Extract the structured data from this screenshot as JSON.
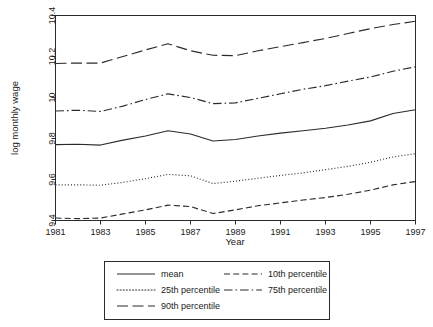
{
  "chart_data": {
    "type": "line",
    "title": "",
    "xlabel": "Year",
    "ylabel": "log monthly wage",
    "xlim": [
      1981,
      1997
    ],
    "ylim": [
      9.4,
      10.4
    ],
    "grid": false,
    "legend_position": "below-center",
    "x": [
      1981,
      1982,
      1983,
      1984,
      1985,
      1986,
      1987,
      1988,
      1989,
      1990,
      1991,
      1992,
      1993,
      1994,
      1995,
      1996,
      1997
    ],
    "xtick_labels": [
      "1981",
      "1983",
      "1985",
      "1987",
      "1989",
      "1991",
      "1993",
      "1995",
      "1997"
    ],
    "xtick_values": [
      1981,
      1983,
      1985,
      1987,
      1989,
      1991,
      1993,
      1995,
      1997
    ],
    "ytick_labels": [
      "9.4",
      "9.6",
      "9.8",
      "10",
      "10.2",
      "10.4"
    ],
    "ytick_values": [
      9.4,
      9.6,
      9.8,
      10.0,
      10.2,
      10.4
    ],
    "series": [
      {
        "name": "mean",
        "dash": "none",
        "values": [
          9.77,
          9.772,
          9.768,
          9.792,
          9.812,
          9.838,
          9.822,
          9.788,
          9.795,
          9.812,
          9.826,
          9.838,
          9.85,
          9.866,
          9.886,
          9.922,
          9.94
        ]
      },
      {
        "name": "10th percentile",
        "dash": "dashed",
        "values": [
          9.412,
          9.409,
          9.412,
          9.432,
          9.452,
          9.475,
          9.468,
          9.434,
          9.452,
          9.472,
          9.486,
          9.5,
          9.512,
          9.528,
          9.548,
          9.574,
          9.59
        ]
      },
      {
        "name": "25th percentile",
        "dash": "dotted",
        "values": [
          9.574,
          9.574,
          9.572,
          9.586,
          9.604,
          9.625,
          9.618,
          9.58,
          9.592,
          9.606,
          9.62,
          9.632,
          9.648,
          9.664,
          9.684,
          9.71,
          9.726
        ]
      },
      {
        "name": "75th percentile",
        "dash": "dashdot",
        "values": [
          9.934,
          9.938,
          9.932,
          9.958,
          9.99,
          10.018,
          10.0,
          9.97,
          9.974,
          9.996,
          10.018,
          10.04,
          10.058,
          10.08,
          10.1,
          10.128,
          10.15
        ]
      },
      {
        "name": "90th percentile",
        "dash": "longdash",
        "values": [
          10.166,
          10.168,
          10.168,
          10.2,
          10.232,
          10.262,
          10.228,
          10.206,
          10.204,
          10.228,
          10.248,
          10.268,
          10.288,
          10.312,
          10.336,
          10.356,
          10.372
        ]
      }
    ]
  },
  "legend": {
    "entries": [
      {
        "label": "mean",
        "dash": "none"
      },
      {
        "label": "10th percentile",
        "dash": "dashed"
      },
      {
        "label": "25th percentile",
        "dash": "dotted"
      },
      {
        "label": "75th percentile",
        "dash": "dashdot"
      },
      {
        "label": "90th percentile",
        "dash": "longdash"
      }
    ]
  },
  "colors": {
    "line": "#2b2b2b",
    "axis": "#2b2b2b",
    "background": "#ffffff",
    "text": "#1a1a1a"
  }
}
